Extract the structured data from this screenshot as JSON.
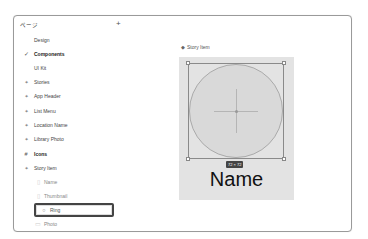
{
  "pages_panel": {
    "title": "ページ",
    "add_icon": "+",
    "items": [
      {
        "label": "Design",
        "icon": ""
      },
      {
        "label": "Components",
        "icon": "✓"
      },
      {
        "label": "UI Kit",
        "icon": ""
      },
      {
        "label": "Stories",
        "icon": "⌖"
      },
      {
        "label": "App Header",
        "icon": "⌖"
      },
      {
        "label": "List Menu",
        "icon": "⌖"
      },
      {
        "label": "Location Name",
        "icon": "⌖"
      },
      {
        "label": "Library Photo",
        "icon": "⌖"
      },
      {
        "label": "Icons",
        "icon": "#"
      },
      {
        "label": "Story Item",
        "icon": "⌖"
      }
    ],
    "layers": [
      {
        "label": "Name",
        "icon": "▯"
      },
      {
        "label": "Thumbnail",
        "icon": "▯"
      },
      {
        "label": "Ring",
        "icon": "○"
      },
      {
        "label": "Photo",
        "icon": "▭"
      }
    ]
  },
  "canvas": {
    "frame_label": "Story Item",
    "frame_icon": "◆",
    "dimension_badge": "72 × 72",
    "name_text": "Name"
  }
}
